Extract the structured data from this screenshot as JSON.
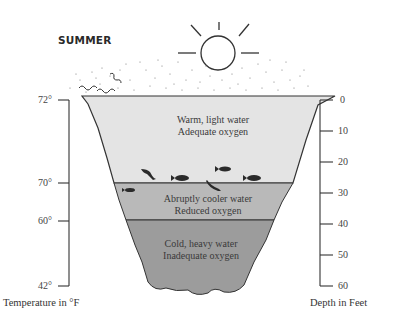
{
  "diagram": {
    "title": "SUMMER",
    "layers": [
      {
        "name": "epilimnion",
        "line1": "Warm, light water",
        "line2": "Adequate oxygen",
        "color": "#e4e4e4"
      },
      {
        "name": "thermocline",
        "line1": "Abruptly cooler water",
        "line2": "Reduced oxygen",
        "color": "#b8b8b8"
      },
      {
        "name": "hypolimnion",
        "line1": "Cold, heavy water",
        "line2": "Inadequate oxygen",
        "color": "#9a9a9a"
      }
    ],
    "temperature_axis": {
      "title": "Temperature in °F",
      "ticks": [
        "72°",
        "70°",
        "60°",
        "42°"
      ]
    },
    "depth_axis": {
      "title": "Depth in Feet",
      "ticks": [
        "0",
        "10",
        "20",
        "30",
        "40",
        "50",
        "60"
      ]
    },
    "icons": [
      "sun-icon",
      "fish-icon",
      "wind-squiggle-icon"
    ]
  }
}
